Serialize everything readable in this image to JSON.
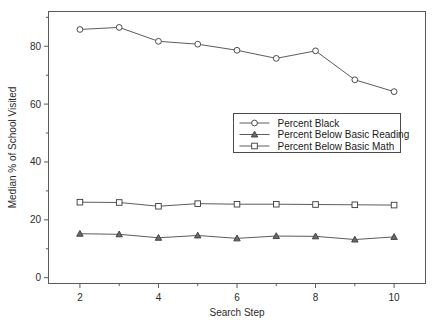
{
  "chart_data": {
    "type": "line",
    "title": "",
    "xlabel": "Search Step",
    "ylabel": "Median % of School Visited",
    "x": [
      2,
      3,
      4,
      5,
      6,
      7,
      8,
      9,
      10
    ],
    "xlim": [
      1.2,
      10.8
    ],
    "ylim": [
      -2,
      92
    ],
    "xticks": [
      2,
      4,
      6,
      8,
      10
    ],
    "xtick_labels": [
      "2",
      "4",
      "6",
      "8",
      "10"
    ],
    "xminor_ticks": [
      3,
      5,
      7,
      9
    ],
    "yticks": [
      0,
      20,
      40,
      60,
      80
    ],
    "ytick_labels": [
      "0",
      "20",
      "40",
      "60",
      "80"
    ],
    "yminor_ticks": [
      10,
      30,
      50,
      70,
      90
    ],
    "grid": false,
    "legend_position": "center-right",
    "series": [
      {
        "name": "Percent Black",
        "marker": "circle",
        "values": [
          85.8,
          86.5,
          81.7,
          80.7,
          78.6,
          75.8,
          78.4,
          68.4,
          64.3
        ]
      },
      {
        "name": "Percent Below Basic Reading",
        "marker": "triangle",
        "values": [
          15.2,
          15.0,
          13.8,
          14.6,
          13.6,
          14.4,
          14.3,
          13.2,
          14.1
        ]
      },
      {
        "name": "Percent Below Basic Math",
        "marker": "square",
        "values": [
          26.1,
          26.0,
          24.7,
          25.6,
          25.4,
          25.4,
          25.3,
          25.2,
          25.1
        ]
      }
    ]
  },
  "figure": {
    "background_color": "#ffffff",
    "line_color": "#4a4a4a",
    "text_color": "#1a1a1a"
  }
}
